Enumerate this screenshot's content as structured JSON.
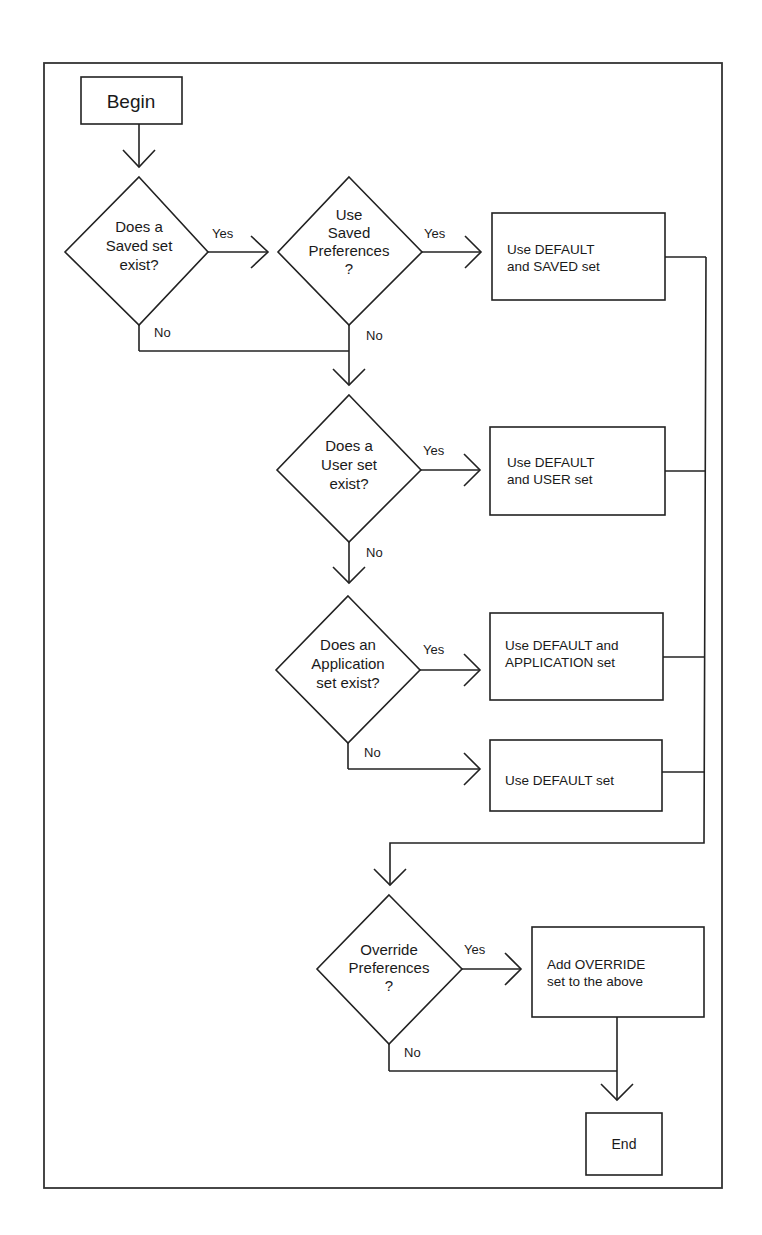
{
  "diagram": {
    "type": "flowchart",
    "nodes": {
      "begin": {
        "label": "Begin"
      },
      "q_saved_exists": {
        "lines": [
          "Does a",
          "Saved set",
          "exist?"
        ]
      },
      "q_use_saved": {
        "lines": [
          "Use",
          "Saved",
          "Preferences",
          "?"
        ]
      },
      "a_default_saved": {
        "lines": [
          "Use DEFAULT",
          "and SAVED set"
        ]
      },
      "q_user_exists": {
        "lines": [
          "Does a",
          "User set",
          "exist?"
        ]
      },
      "a_default_user": {
        "lines": [
          "Use DEFAULT",
          "and USER set"
        ]
      },
      "q_app_exists": {
        "lines": [
          "Does an",
          "Application",
          "set exist?"
        ]
      },
      "a_default_app": {
        "lines": [
          "Use DEFAULT and",
          "APPLICATION set"
        ]
      },
      "a_default": {
        "lines": [
          "Use DEFAULT set"
        ]
      },
      "q_override": {
        "lines": [
          "Override",
          "Preferences",
          "?"
        ]
      },
      "a_add_override": {
        "lines": [
          "Add OVERRIDE",
          "set to the above"
        ]
      },
      "end": {
        "label": "End"
      }
    },
    "edge_labels": {
      "saved_yes": "Yes",
      "saved_no": "No",
      "use_saved_yes": "Yes",
      "use_saved_no": "No",
      "user_yes": "Yes",
      "user_no": "No",
      "app_yes": "Yes",
      "app_no": "No",
      "override_yes": "Yes",
      "override_no": "No"
    },
    "edges": [
      [
        "begin",
        "q_saved_exists",
        ""
      ],
      [
        "q_saved_exists",
        "q_use_saved",
        "Yes"
      ],
      [
        "q_saved_exists",
        "q_user_exists",
        "No"
      ],
      [
        "q_use_saved",
        "a_default_saved",
        "Yes"
      ],
      [
        "q_use_saved",
        "q_user_exists",
        "No"
      ],
      [
        "q_user_exists",
        "a_default_user",
        "Yes"
      ],
      [
        "q_user_exists",
        "q_app_exists",
        "No"
      ],
      [
        "q_app_exists",
        "a_default_app",
        "Yes"
      ],
      [
        "q_app_exists",
        "a_default",
        "No"
      ],
      [
        "a_default_saved",
        "q_override",
        ""
      ],
      [
        "a_default_user",
        "q_override",
        ""
      ],
      [
        "a_default_app",
        "q_override",
        ""
      ],
      [
        "a_default",
        "q_override",
        ""
      ],
      [
        "q_override",
        "a_add_override",
        "Yes"
      ],
      [
        "q_override",
        "end",
        "No"
      ],
      [
        "a_add_override",
        "end",
        ""
      ]
    ]
  }
}
